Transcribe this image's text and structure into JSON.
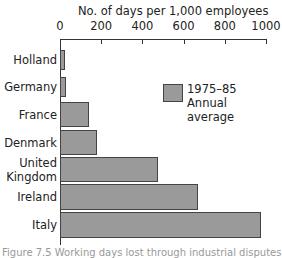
{
  "chart_data": {
    "type": "bar",
    "orientation": "horizontal",
    "title": "",
    "xlabel": "No. of days per 1,000 employees",
    "ylabel": "",
    "xlim": [
      0,
      1000
    ],
    "x_ticks": [
      "0",
      "200",
      "400",
      "600",
      "800",
      "1000"
    ],
    "categories": [
      "Holland",
      "Germany",
      "France",
      "Denmark",
      "United Kingdom",
      "Ireland",
      "Italy"
    ],
    "category_labels": [
      [
        "Holland"
      ],
      [
        "Germany"
      ],
      [
        "France"
      ],
      [
        "Denmark"
      ],
      [
        "United",
        "Kingdom"
      ],
      [
        "Ireland"
      ],
      [
        "Italy"
      ]
    ],
    "series": [
      {
        "name": "1975–85 Annual average",
        "values": [
          25,
          30,
          140,
          180,
          475,
          670,
          975
        ]
      }
    ],
    "legend": {
      "position": "upper right inside",
      "lines": [
        "1975–85",
        "Annual average"
      ]
    },
    "grid": false
  },
  "caption": "Figure 7.5  Working days lost through industrial disputes"
}
